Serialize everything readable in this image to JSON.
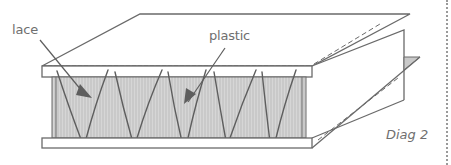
{
  "diagram": {
    "title": "Diag 2",
    "labels": {
      "lace": "lace",
      "plastic": "plastic"
    },
    "parts": [
      {
        "name": "top-board",
        "description": "upper board folded back"
      },
      {
        "name": "plastic-core",
        "description": "shaded plastic sheet"
      },
      {
        "name": "lace",
        "description": "zig-zag lace binding boards"
      },
      {
        "name": "bottom-board",
        "description": "lower board"
      },
      {
        "name": "hinge-panel",
        "description": "folded side panel with dashed fold lines"
      }
    ],
    "colors": {
      "stroke": "#6a6a6a",
      "fill_core": "#cfcfcf",
      "text": "#6f6f6f",
      "background": "#ffffff"
    }
  }
}
